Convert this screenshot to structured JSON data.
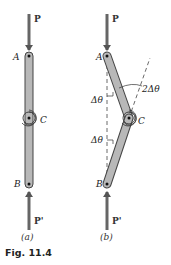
{
  "figure": {
    "caption": "Fig. 11.4",
    "colors": {
      "bar_fill": "#b8b8b8",
      "bar_stroke": "#444444",
      "arrow": "#666666",
      "text": "#222222"
    },
    "panel_a": {
      "label": "(a)",
      "loads": {
        "top": "P",
        "bottom": "P'"
      },
      "points": {
        "A": "A",
        "B": "B",
        "C": "C"
      }
    },
    "panel_b": {
      "label": "(b)",
      "loads": {
        "top": "P",
        "bottom": "P'"
      },
      "points": {
        "A": "A",
        "B": "B",
        "C": "C"
      },
      "angles": {
        "upper": "Δθ",
        "lower": "Δθ",
        "at_c": "2Δθ"
      }
    }
  }
}
